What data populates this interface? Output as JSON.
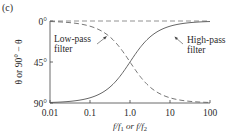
{
  "panel_label": "(c)",
  "chart_data": {
    "type": "line",
    "title": "",
    "xlabel": "f/f1 or f/f2",
    "ylabel": "θ or 90° − θ",
    "xscale": "log",
    "xlim": [
      0.01,
      100
    ],
    "ylim": [
      90,
      0
    ],
    "y_inverted": true,
    "grid": false,
    "xticks": [
      "0.01",
      "0.1",
      "1.0",
      "10",
      "100"
    ],
    "yticks": [
      "0°",
      "45°",
      "90°"
    ],
    "x": [
      0.01,
      0.02,
      0.05,
      0.1,
      0.2,
      0.5,
      1.0,
      2,
      5,
      10,
      20,
      50,
      100
    ],
    "series": [
      {
        "name": "High-pass filter",
        "style": "solid",
        "values": [
          89.4,
          88.9,
          87.1,
          84.3,
          78.7,
          63.4,
          45.0,
          26.6,
          11.3,
          5.7,
          2.9,
          1.1,
          0.6
        ]
      },
      {
        "name": "Low-pass filter",
        "style": "dashed",
        "values": [
          0.6,
          1.1,
          2.9,
          5.7,
          11.3,
          26.6,
          45.0,
          63.4,
          78.7,
          84.3,
          87.1,
          88.9,
          89.4
        ]
      },
      {
        "name": "0° reference",
        "style": "dashed",
        "values": [
          0,
          0,
          0,
          0,
          0,
          0,
          0,
          0,
          0,
          0,
          0,
          0,
          0
        ]
      }
    ],
    "annotations": [
      {
        "text_line1": "Low-pass",
        "text_line2": "filter",
        "points_to": "Low-pass filter curve near f≈0.2"
      },
      {
        "text_line1": "High-pass",
        "text_line2": "filter",
        "points_to": "High-pass filter curve near f≈5"
      }
    ]
  },
  "labels": {
    "ytick_0": "0°",
    "ytick_45": "45°",
    "ytick_90": "90°",
    "xtick_0": "0.01",
    "xtick_1": "0.1",
    "xtick_2": "1.0",
    "xtick_3": "10",
    "xtick_4": "100",
    "ylabel": "θ or 90° − θ",
    "xlabel_a": "f/f",
    "xlabel_sub1": "1",
    "xlabel_or": " or f/f",
    "xlabel_sub2": "2",
    "lowpass_1": "Low-pass",
    "lowpass_2": "filter",
    "highpass_1": "High-pass",
    "highpass_2": "filter"
  }
}
